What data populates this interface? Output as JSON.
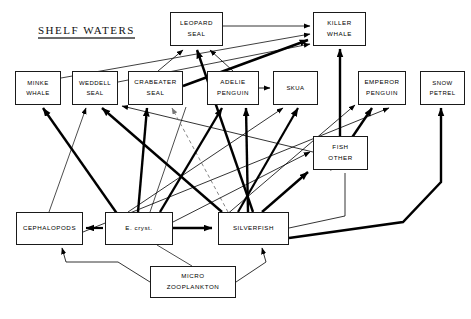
{
  "diagram": {
    "title": "SHELF WATERS",
    "type": "food-web",
    "background": "#ffffff",
    "line_color": "#000000",
    "box_border_color": "#1a1a1a",
    "nodes": [
      {
        "id": "leopard-seal",
        "label": "LEOPARD\nSEAL",
        "x": 170,
        "y": 12,
        "w": 53,
        "h": 34,
        "trophic": "predator"
      },
      {
        "id": "killer-whale",
        "label": "KILLER\nWHALE",
        "x": 313,
        "y": 12,
        "w": 53,
        "h": 34,
        "trophic": "predator"
      },
      {
        "id": "minke-whale",
        "label": "MINKE\nWHALE",
        "x": 15,
        "y": 71,
        "w": 46,
        "h": 34,
        "trophic": "consumer"
      },
      {
        "id": "weddell-seal",
        "label": "WEDDELL\nSEAL",
        "x": 72,
        "y": 71,
        "w": 46,
        "h": 34,
        "trophic": "consumer"
      },
      {
        "id": "crabeater-seal",
        "label": "CRABEATER\nSEAL",
        "x": 128,
        "y": 71,
        "w": 55,
        "h": 34,
        "trophic": "consumer"
      },
      {
        "id": "adelie-penguin",
        "label": "ADELIE\nPENGUIN",
        "x": 207,
        "y": 71,
        "w": 52,
        "h": 34,
        "trophic": "consumer"
      },
      {
        "id": "skua",
        "label": "SKUA",
        "x": 273,
        "y": 71,
        "w": 45,
        "h": 34,
        "trophic": "consumer"
      },
      {
        "id": "emperor-penguin",
        "label": "EMPEROR\nPENGUIN",
        "x": 358,
        "y": 71,
        "w": 48,
        "h": 34,
        "trophic": "consumer"
      },
      {
        "id": "snow-petrel",
        "label": "SNOW\nPETREL",
        "x": 420,
        "y": 71,
        "w": 45,
        "h": 34,
        "trophic": "consumer"
      },
      {
        "id": "fish-other",
        "label": "FISH\nOTHER",
        "x": 313,
        "y": 136,
        "w": 55,
        "h": 34,
        "trophic": "intermediate"
      },
      {
        "id": "cephalopods",
        "label": "CEPHALOPODS",
        "x": 16,
        "y": 212,
        "w": 67,
        "h": 33,
        "trophic": "intermediate"
      },
      {
        "id": "e-cryst",
        "label": "E. cryst.",
        "x": 105,
        "y": 212,
        "w": 68,
        "h": 33,
        "trophic": "prey"
      },
      {
        "id": "silverfish",
        "label": "SILVERFISH",
        "x": 218,
        "y": 212,
        "w": 71,
        "h": 33,
        "trophic": "prey"
      },
      {
        "id": "micro-zooplankton",
        "label": "MICRO\nZOOPLANKTON",
        "x": 150,
        "y": 266,
        "w": 86,
        "h": 32,
        "trophic": "base"
      }
    ],
    "links": [
      {
        "from": "crabeater-seal",
        "to": "leopard-seal",
        "weight": "thin"
      },
      {
        "from": "adelie-penguin",
        "to": "leopard-seal",
        "weight": "thick"
      },
      {
        "from": "silverfish",
        "to": "leopard-seal",
        "weight": "thick"
      },
      {
        "from": "e-cryst",
        "to": "leopard-seal",
        "weight": "thin"
      },
      {
        "from": "leopard-seal",
        "to": "killer-whale",
        "weight": "thin"
      },
      {
        "from": "minke-whale",
        "to": "killer-whale",
        "weight": "thin"
      },
      {
        "from": "weddell-seal",
        "to": "killer-whale",
        "weight": "thin"
      },
      {
        "from": "crabeater-seal",
        "to": "killer-whale",
        "weight": "thick"
      },
      {
        "from": "fish-other",
        "to": "killer-whale",
        "weight": "thick"
      },
      {
        "from": "e-cryst",
        "to": "minke-whale",
        "weight": "thick"
      },
      {
        "from": "cephalopods",
        "to": "weddell-seal",
        "weight": "thin"
      },
      {
        "from": "silverfish",
        "to": "weddell-seal",
        "weight": "thick"
      },
      {
        "from": "fish-other",
        "to": "weddell-seal",
        "weight": "thin"
      },
      {
        "from": "e-cryst",
        "to": "crabeater-seal",
        "weight": "thick"
      },
      {
        "from": "silverfish",
        "to": "crabeater-seal",
        "weight": "dashed"
      },
      {
        "from": "e-cryst",
        "to": "adelie-penguin",
        "weight": "thick"
      },
      {
        "from": "silverfish",
        "to": "adelie-penguin",
        "weight": "thick"
      },
      {
        "from": "adelie-penguin",
        "to": "skua",
        "weight": "thin"
      },
      {
        "from": "e-cryst",
        "to": "skua",
        "weight": "thin"
      },
      {
        "from": "silverfish",
        "to": "skua",
        "weight": "thin"
      },
      {
        "from": "silverfish",
        "to": "emperor-penguin",
        "weight": "thin"
      },
      {
        "from": "fish-other",
        "to": "emperor-penguin",
        "weight": "thick"
      },
      {
        "from": "cephalopods",
        "to": "emperor-penguin",
        "weight": "thin"
      },
      {
        "from": "silverfish",
        "to": "snow-petrel",
        "weight": "thick"
      },
      {
        "from": "e-cryst",
        "to": "fish-other",
        "weight": "thin"
      },
      {
        "from": "silverfish",
        "to": "fish-other",
        "weight": "thick"
      },
      {
        "from": "e-cryst",
        "to": "cephalopods",
        "weight": "thick"
      },
      {
        "from": "e-cryst",
        "to": "silverfish",
        "weight": "thick"
      },
      {
        "from": "micro-zooplankton",
        "to": "cephalopods",
        "weight": "thin"
      },
      {
        "from": "micro-zooplankton",
        "to": "silverfish",
        "weight": "thin"
      },
      {
        "from": "micro-zooplankton",
        "to": "e-cryst",
        "weight": "thin"
      }
    ]
  }
}
